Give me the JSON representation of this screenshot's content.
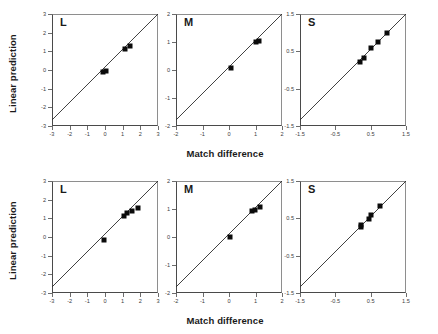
{
  "figure": {
    "ylabel": "Linear prediction",
    "xlabel": "Match difference",
    "marker_color": "#0b0b0b",
    "line_color": "#2b2b2b",
    "axis_color": "#4a4a4a"
  },
  "chart_data": [
    {
      "type": "scatter",
      "row": "top",
      "panel_label": "L",
      "title": "",
      "xlabel": "Match difference",
      "ylabel": "Linear prediction",
      "xlim": [
        -3,
        3
      ],
      "ylim": [
        -3,
        3
      ],
      "xticks": [
        -3,
        -2,
        -1,
        0,
        1,
        2,
        3
      ],
      "yticks": [
        -3,
        -2,
        -1,
        0,
        1,
        2,
        3
      ],
      "xticklabels": [
        "-3",
        "-2",
        "-1",
        "0",
        "1",
        "2",
        "3"
      ],
      "yticklabels": [
        "-3",
        "-2",
        "-1",
        "0",
        "1",
        "2",
        "3"
      ],
      "grid": false,
      "legend": "none",
      "annotations": [
        "identity line y = x"
      ],
      "points": [
        {
          "x": -0.1,
          "y": -0.12
        },
        {
          "x": 0.05,
          "y": -0.08
        },
        {
          "x": 1.15,
          "y": 1.12
        },
        {
          "x": 1.4,
          "y": 1.3
        }
      ]
    },
    {
      "type": "scatter",
      "row": "top",
      "panel_label": "M",
      "title": "",
      "xlabel": "Match difference",
      "ylabel": "Linear prediction",
      "xlim": [
        -2,
        2
      ],
      "ylim": [
        -2,
        2
      ],
      "xticks": [
        -2,
        -1,
        0,
        1,
        2
      ],
      "yticks": [
        -2,
        -1,
        0,
        1,
        2
      ],
      "xticklabels": [
        "-2",
        "-1",
        "0",
        "1",
        "2"
      ],
      "yticklabels": [
        "-2",
        "-1",
        "0",
        "1",
        "2"
      ],
      "grid": false,
      "legend": "none",
      "annotations": [
        "identity line y = x"
      ],
      "points": [
        {
          "x": 0.08,
          "y": 0.06
        },
        {
          "x": 1.02,
          "y": 1.0
        },
        {
          "x": 1.15,
          "y": 1.05
        }
      ]
    },
    {
      "type": "scatter",
      "row": "top",
      "panel_label": "S",
      "title": "",
      "xlabel": "Match difference",
      "ylabel": "Linear prediction",
      "xlim": [
        -1.5,
        1.5
      ],
      "ylim": [
        -1.5,
        1.5
      ],
      "xticks": [
        -1.5,
        -0.5,
        0.5,
        1.5
      ],
      "yticks": [
        -1.5,
        -0.5,
        0.5,
        1.5
      ],
      "xticklabels": [
        "-1.5",
        "-0.5",
        "0.5",
        "1.5"
      ],
      "yticklabels": [
        "-1.5",
        "-0.5",
        "0.5",
        "1.5"
      ],
      "grid": false,
      "legend": "none",
      "annotations": [
        "identity line y = x"
      ],
      "points": [
        {
          "x": 0.2,
          "y": 0.21
        },
        {
          "x": 0.3,
          "y": 0.33
        },
        {
          "x": 0.52,
          "y": 0.6
        },
        {
          "x": 0.72,
          "y": 0.74
        },
        {
          "x": 0.95,
          "y": 1.0
        }
      ]
    },
    {
      "type": "scatter",
      "row": "bottom",
      "panel_label": "L",
      "title": "",
      "xlabel": "Match difference",
      "ylabel": "Linear prediction",
      "xlim": [
        -3,
        3
      ],
      "ylim": [
        -3,
        3
      ],
      "xticks": [
        -3,
        -2,
        -1,
        0,
        1,
        2,
        3
      ],
      "yticks": [
        -3,
        -2,
        -1,
        0,
        1,
        2,
        3
      ],
      "xticklabels": [
        "-3",
        "-2",
        "-1",
        "0",
        "1",
        "2",
        "3"
      ],
      "yticklabels": [
        "-3",
        "-2",
        "-1",
        "0",
        "1",
        "2",
        "3"
      ],
      "grid": false,
      "legend": "none",
      "annotations": [
        "identity line y = x"
      ],
      "points": [
        {
          "x": -0.05,
          "y": -0.18
        },
        {
          "x": 1.1,
          "y": 1.1
        },
        {
          "x": 1.25,
          "y": 1.3
        },
        {
          "x": 1.5,
          "y": 1.4
        },
        {
          "x": 1.85,
          "y": 1.55
        }
      ]
    },
    {
      "type": "scatter",
      "row": "bottom",
      "panel_label": "M",
      "title": "",
      "xlabel": "Match difference",
      "ylabel": "Linear prediction",
      "xlim": [
        -2,
        2
      ],
      "ylim": [
        -2,
        2
      ],
      "xticks": [
        -2,
        -1,
        0,
        1,
        2
      ],
      "yticks": [
        -2,
        -1,
        0,
        1,
        2
      ],
      "xticklabels": [
        "-2",
        "-1",
        "0",
        "1",
        "2"
      ],
      "yticklabels": [
        "-2",
        "-1",
        "0",
        "1",
        "2"
      ],
      "grid": false,
      "legend": "none",
      "annotations": [
        "identity line y = x"
      ],
      "points": [
        {
          "x": 0.05,
          "y": 0.0
        },
        {
          "x": 0.88,
          "y": 0.92
        },
        {
          "x": 0.98,
          "y": 0.95
        },
        {
          "x": 1.18,
          "y": 1.08
        }
      ]
    },
    {
      "type": "scatter",
      "row": "bottom",
      "panel_label": "S",
      "title": "",
      "xlabel": "Match difference",
      "ylabel": "Linear prediction",
      "xlim": [
        -1.5,
        1.5
      ],
      "ylim": [
        -1.5,
        1.5
      ],
      "xticks": [
        -1.5,
        -0.5,
        0.5,
        1.5
      ],
      "yticks": [
        -1.5,
        -0.5,
        0.5,
        1.5
      ],
      "xticklabels": [
        "-1.5",
        "-0.5",
        "0.5",
        "1.5"
      ],
      "yticklabels": [
        "-1.5",
        "-0.5",
        "0.5",
        "1.5"
      ],
      "grid": false,
      "legend": "none",
      "annotations": [
        "identity line y = x"
      ],
      "points": [
        {
          "x": 0.22,
          "y": 0.26
        },
        {
          "x": 0.24,
          "y": 0.33
        },
        {
          "x": 0.45,
          "y": 0.48
        },
        {
          "x": 0.52,
          "y": 0.6
        },
        {
          "x": 0.75,
          "y": 0.82
        }
      ]
    }
  ]
}
